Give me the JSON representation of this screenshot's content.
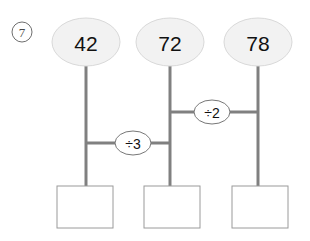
{
  "problem": {
    "marker_label": "7",
    "marker_icon": "circled-number-icon"
  },
  "nodes": [
    {
      "id": "node-1",
      "value": "42",
      "cx": 86,
      "cy": 42,
      "rx": 34,
      "ry": 24
    },
    {
      "id": "node-2",
      "value": "72",
      "cx": 170,
      "cy": 42,
      "rx": 34,
      "ry": 24
    },
    {
      "id": "node-3",
      "value": "78",
      "cx": 258,
      "cy": 42,
      "rx": 34,
      "ry": 24
    }
  ],
  "operators": [
    {
      "id": "op-div-3",
      "label": "÷3",
      "cx": 133,
      "cy": 143,
      "rx": 18,
      "ry": 12
    },
    {
      "id": "op-div-2",
      "label": "÷2",
      "cx": 212,
      "cy": 112,
      "rx": 18,
      "ry": 12
    }
  ],
  "connectors": {
    "vertical": [
      {
        "id": "stem-1",
        "x": 86,
        "y1": 66,
        "y2": 186
      },
      {
        "id": "stem-2",
        "x": 170,
        "y1": 66,
        "y2": 186
      },
      {
        "id": "stem-3",
        "x": 258,
        "y1": 66,
        "y2": 186
      }
    ],
    "horizontal": [
      {
        "id": "link-div-3",
        "y": 143,
        "x1": 86,
        "x2": 170
      },
      {
        "id": "link-div-2",
        "y": 112,
        "x1": 170,
        "x2": 258
      }
    ]
  },
  "answer_boxes": [
    {
      "id": "answer-box-1",
      "value": "",
      "x": 57,
      "y": 186,
      "width": 56,
      "height": 42
    },
    {
      "id": "answer-box-2",
      "value": "",
      "x": 144,
      "y": 186,
      "width": 56,
      "height": 42
    },
    {
      "id": "answer-box-3",
      "value": "",
      "x": 232,
      "y": 186,
      "width": 56,
      "height": 42
    }
  ],
  "colors": {
    "node_fill": "#f2f2f2",
    "node_stroke": "#d9d9d9",
    "connector": "#808080",
    "box_stroke": "#9a9a9a",
    "text": "#111111"
  }
}
